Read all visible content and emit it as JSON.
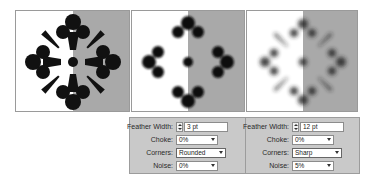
{
  "previews": [
    {
      "id": "original",
      "style": "sharp"
    },
    {
      "id": "feather-3pt-rounded",
      "style": "rounded-blur"
    },
    {
      "id": "feather-12pt-sharp-noise",
      "style": "heavy-blur"
    }
  ],
  "settings": [
    {
      "feather_width_label": "Feather Width:",
      "feather_width_value": "3 pt",
      "choke_label": "Choke:",
      "choke_value": "0%",
      "corners_label": "Corners:",
      "corners_value": "Rounded",
      "noise_label": "Noise:",
      "noise_value": "0%"
    },
    {
      "feather_width_label": "Feather Width:",
      "feather_width_value": "12 pt",
      "choke_label": "Choke:",
      "choke_value": "0%",
      "corners_label": "Corners:",
      "corners_value": "Sharp",
      "noise_label": "Noise:",
      "noise_value": "5%"
    }
  ],
  "colors": {
    "panel_bg": "#c9c9c9",
    "preview_gray": "#a9a9a9",
    "ink": "#111111"
  }
}
